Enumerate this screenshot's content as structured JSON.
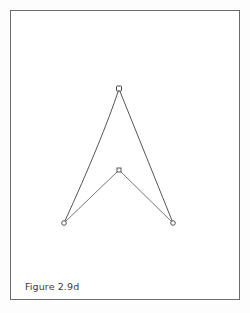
{
  "figure": {
    "caption": "Figure 2.9d",
    "stroke_color": "#555555",
    "frame_color": "#6b6b6b",
    "points": [
      {
        "name": "apex",
        "x": 119,
        "y": 89
      },
      {
        "name": "inner",
        "x": 119,
        "y": 170
      },
      {
        "name": "left",
        "x": 64,
        "y": 223
      },
      {
        "name": "right",
        "x": 173,
        "y": 223
      }
    ],
    "segments": [
      {
        "from": "left",
        "to": "apex",
        "curve": "concave"
      },
      {
        "from": "apex",
        "to": "right",
        "curve": "straight"
      },
      {
        "from": "left",
        "to": "inner",
        "curve": "straight"
      },
      {
        "from": "inner",
        "to": "right",
        "curve": "straight"
      }
    ]
  }
}
